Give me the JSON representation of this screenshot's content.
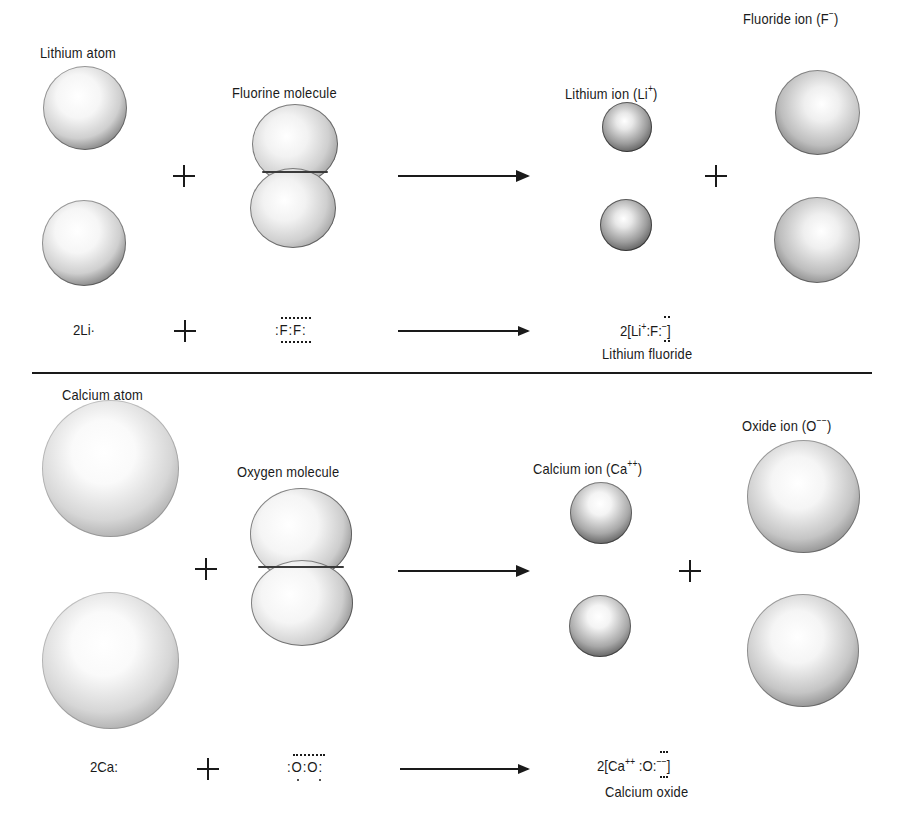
{
  "top_panel": {
    "reactant_1_label": "Lithium atom",
    "reactant_2_label": "Fluorine molecule",
    "product_1_label": "Lithium ion (Li",
    "product_1_charge": "+",
    "product_2_label": "Fluoride ion (F",
    "product_2_charge": "−",
    "close_paren": ")",
    "plus_symbol": "+",
    "equation": {
      "reactant_1": "2Li·",
      "reactant_2": ":F:F:",
      "product_formula_prefix": "2[Li",
      "product_formula_charge": "+",
      "product_formula_mid": ":F:",
      "product_formula_anion_charge": "−",
      "product_formula_suffix": "]",
      "product_name": "Lithium fluoride"
    }
  },
  "bottom_panel": {
    "reactant_1_label": "Calcium atom",
    "reactant_2_label": "Oxygen molecule",
    "product_1_label": "Calcium ion (Ca",
    "product_1_charge": "++",
    "product_2_label": "Oxide ion (O",
    "product_2_charge": "−−",
    "close_paren": ")",
    "plus_symbol": "+",
    "equation": {
      "reactant_1": "2Ca:",
      "reactant_2": ":O:O:",
      "product_formula_prefix": "2[Ca",
      "product_formula_charge": "++",
      "product_formula_mid": " :O:",
      "product_formula_anion_charge": "−−",
      "product_formula_suffix": "]",
      "product_name": "Calcium oxide"
    }
  },
  "colors": {
    "ink": "#1a1a1a",
    "background": "#ffffff"
  }
}
